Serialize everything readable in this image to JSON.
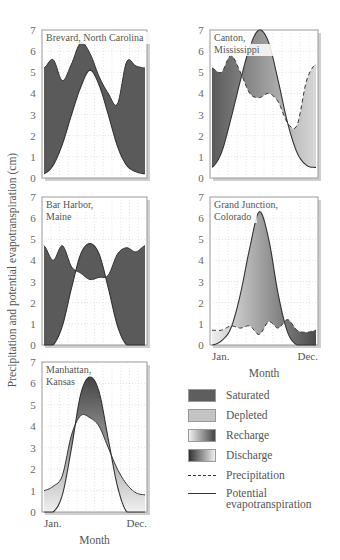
{
  "figure": {
    "y_axis_label": "Precipitation and potential evapotranspiration (cm)",
    "x_axis_label": "Month",
    "x_start_label": "Jan.",
    "x_end_label": "Dec.",
    "y_ticks": [
      "0",
      "1",
      "2",
      "3",
      "4",
      "5",
      "6",
      "7"
    ]
  },
  "legend": {
    "items": [
      {
        "key": "saturated",
        "label": "Saturated"
      },
      {
        "key": "depleted",
        "label": "Depleted"
      },
      {
        "key": "recharge",
        "label": "Recharge"
      },
      {
        "key": "discharge",
        "label": "Discharge"
      },
      {
        "key": "precipitation",
        "label": "Precipitation"
      },
      {
        "key": "pet",
        "label": "Potential evapotranspiration"
      }
    ]
  },
  "colors": {
    "saturated": "#5a5a5a",
    "depleted": "#b8b8b8",
    "grid": "#c8c8c8",
    "frame": "#9a9a9a",
    "line": "#333333"
  },
  "chart_data": [
    {
      "type": "area",
      "title": "Brevard, North Carolina",
      "xlabel": "Month",
      "ylabel": "Precipitation and potential evapotranspiration (cm)",
      "ylim": [
        0,
        7
      ],
      "x": [
        1,
        2,
        3,
        4,
        5,
        6,
        7,
        8,
        9,
        10,
        11,
        12
      ],
      "series": [
        {
          "name": "Precipitation",
          "values": [
            5.2,
            5.6,
            4.6,
            5.4,
            6.4,
            5.9,
            4.8,
            4.0,
            3.5,
            5.5,
            5.3,
            5.2
          ]
        },
        {
          "name": "Potential evapotranspiration",
          "values": [
            0.2,
            0.6,
            1.6,
            3.0,
            4.3,
            5.1,
            4.4,
            3.0,
            1.5,
            0.6,
            0.3,
            0.2
          ]
        }
      ],
      "grid": true
    },
    {
      "type": "area",
      "title": "Canton, Mississippi",
      "xlabel": "Month",
      "ylabel": "Precipitation and potential evapotranspiration (cm)",
      "ylim": [
        0,
        7
      ],
      "x": [
        1,
        2,
        3,
        4,
        5,
        6,
        7,
        8,
        9,
        10,
        11,
        12
      ],
      "series": [
        {
          "name": "Precipitation",
          "values": [
            5.2,
            5.0,
            5.8,
            5.0,
            4.0,
            3.8,
            4.0,
            3.6,
            2.6,
            2.5,
            4.6,
            5.4
          ]
        },
        {
          "name": "Potential evapotranspiration",
          "values": [
            0.5,
            1.2,
            2.8,
            4.6,
            6.2,
            7.0,
            6.4,
            4.6,
            2.6,
            1.2,
            0.6,
            0.5
          ]
        }
      ],
      "grid": true
    },
    {
      "type": "area",
      "title": "Bar Harbor, Maine",
      "xlabel": "Month",
      "ylabel": "Precipitation and potential evapotranspiration (cm)",
      "ylim": [
        0,
        7
      ],
      "x": [
        1,
        2,
        3,
        4,
        5,
        6,
        7,
        8,
        9,
        10,
        11,
        12
      ],
      "series": [
        {
          "name": "Precipitation",
          "values": [
            4.7,
            4.0,
            4.7,
            3.7,
            3.4,
            3.1,
            3.2,
            3.3,
            4.3,
            4.6,
            4.4,
            4.7
          ]
        },
        {
          "name": "Potential evapotranspiration",
          "values": [
            0,
            0,
            0.9,
            2.7,
            4.3,
            4.8,
            4.3,
            2.7,
            0.9,
            0,
            0,
            0
          ]
        }
      ],
      "grid": true
    },
    {
      "type": "area",
      "title": "Grand Junction, Colorado",
      "xlabel": "Month",
      "ylabel": "Precipitation and potential evapotranspiration (cm)",
      "ylim": [
        0,
        7
      ],
      "x": [
        1,
        2,
        3,
        4,
        5,
        6,
        7,
        8,
        9,
        10,
        11,
        12
      ],
      "series": [
        {
          "name": "Precipitation",
          "values": [
            0.7,
            0.7,
            0.9,
            0.8,
            0.9,
            0.5,
            1.1,
            0.8,
            1.2,
            0.7,
            0.6,
            0.7
          ]
        },
        {
          "name": "Potential evapotranspiration",
          "values": [
            0,
            0.2,
            0.8,
            2.4,
            4.6,
            6.3,
            5.0,
            2.4,
            0.6,
            0,
            0,
            0
          ]
        }
      ],
      "grid": true
    },
    {
      "type": "area",
      "title": "Manhattan, Kansas",
      "xlabel": "Month",
      "ylabel": "Precipitation and potential evapotranspiration (cm)",
      "ylim": [
        0,
        7
      ],
      "x": [
        1,
        2,
        3,
        4,
        5,
        6,
        7,
        8,
        9,
        10,
        11,
        12
      ],
      "series": [
        {
          "name": "Precipitation",
          "values": [
            1.0,
            1.2,
            1.7,
            3.6,
            4.5,
            4.4,
            4.0,
            3.0,
            2.0,
            1.3,
            0.9,
            0.8
          ]
        },
        {
          "name": "Potential evapotranspiration",
          "values": [
            0,
            0,
            0.8,
            3.0,
            5.5,
            6.3,
            5.6,
            3.4,
            1.2,
            0,
            0,
            0
          ]
        }
      ],
      "grid": true
    }
  ],
  "panels": [
    {
      "title_lines": [
        "Brevard, North Carolina"
      ]
    },
    {
      "title_lines": [
        "Canton,",
        "Mississippi"
      ]
    },
    {
      "title_lines": [
        "Bar Harbor,",
        "Maine"
      ]
    },
    {
      "title_lines": [
        "Grand Junction,",
        "Colorado"
      ]
    },
    {
      "title_lines": [
        "Manhattan,",
        "Kansas"
      ]
    }
  ]
}
